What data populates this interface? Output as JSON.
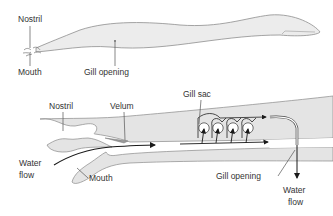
{
  "top_view": {
    "labels": {
      "nostril": "Nostril",
      "mouth": "Mouth",
      "gill_opening": "Gill opening"
    }
  },
  "detail_view": {
    "labels": {
      "nostril": "Nostril",
      "velum": "Velum",
      "gill_sac": "Gill sac",
      "water_flow_in": "Water flow",
      "water_flow_in_line1": "Water",
      "water_flow_in_line2": "flow",
      "mouth": "Mouth",
      "gill_opening": "Gill opening",
      "water_flow_out_line1": "Water",
      "water_flow_out_line2": "flow"
    }
  },
  "colors": {
    "body_fill": "#e4e4e4",
    "outline": "#8a8a8a",
    "arrow": "#1a1a1a",
    "label_text": "#333333"
  }
}
